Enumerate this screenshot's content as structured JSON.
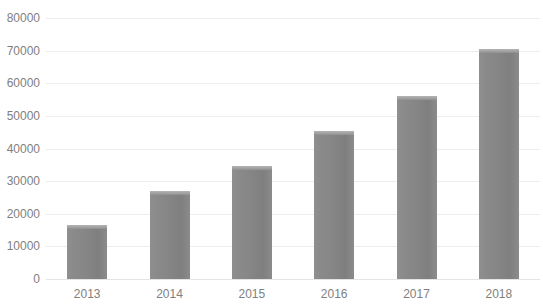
{
  "chart_data": {
    "type": "bar",
    "title": "",
    "subtitle": "",
    "xlabel": "",
    "ylabel": "",
    "categories": [
      "2013",
      "2014",
      "2015",
      "2016",
      "2017",
      "2018"
    ],
    "values": [
      16600,
      27000,
      34500,
      45500,
      56000,
      70500
    ],
    "series": [
      {
        "name": "",
        "values": [
          16600,
          27000,
          34500,
          45500,
          56000,
          70500
        ]
      }
    ],
    "ylim": [
      0,
      80000
    ],
    "ytick_labels": [
      "0",
      "10000",
      "20000",
      "30000",
      "40000",
      "50000",
      "60000",
      "70000",
      "80000"
    ],
    "ytick_values": [
      0,
      10000,
      20000,
      30000,
      40000,
      50000,
      60000,
      70000,
      80000
    ],
    "grid": true,
    "legend": false,
    "legend_position": "none",
    "annotations": [],
    "colors": {
      "bar": "#888888",
      "bar_highlight": "#b4b4b4",
      "gridline": "#ededed",
      "baseline": "#e4e4e4",
      "tick_label": "#808080",
      "background": "#ffffff"
    }
  }
}
